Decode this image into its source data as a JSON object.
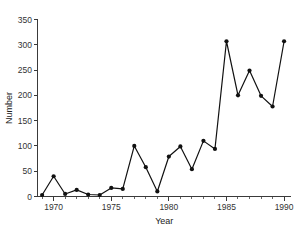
{
  "chart_data": {
    "type": "line",
    "title": "",
    "xlabel": "Year",
    "ylabel": "Number",
    "xlim": [
      1968.6,
      1990.6
    ],
    "ylim": [
      0,
      350
    ],
    "grid": false,
    "legend": null,
    "x": [
      1969,
      1970,
      1971,
      1972,
      1973,
      1974,
      1975,
      1976,
      1977,
      1978,
      1979,
      1980,
      1981,
      1982,
      1983,
      1984,
      1985,
      1986,
      1987,
      1988,
      1989,
      1990
    ],
    "values": [
      3,
      40,
      5,
      13,
      4,
      3,
      17,
      15,
      100,
      58,
      10,
      79,
      99,
      54,
      110,
      94,
      307,
      200,
      249,
      199,
      178,
      307
    ],
    "series": [
      {
        "name": "Number",
        "values": [
          3,
          40,
          5,
          13,
          4,
          3,
          17,
          15,
          100,
          58,
          10,
          79,
          99,
          54,
          110,
          94,
          307,
          200,
          249,
          199,
          178,
          307
        ],
        "color": "#111111",
        "marker": "filled-circle"
      }
    ],
    "y_ticks": [
      0,
      50,
      100,
      150,
      200,
      250,
      300,
      350
    ],
    "y_tick_labels": [
      "0",
      "50",
      "100",
      "150",
      "200",
      "250",
      "300",
      "350"
    ],
    "x_ticks_major": [
      1970,
      1975,
      1980,
      1985,
      1990
    ],
    "x_tick_labels": [
      "1970",
      "1975",
      "1980",
      "1985",
      "1990"
    ],
    "x_ticks_minor": [
      1969,
      1971,
      1972,
      1973,
      1974,
      1976,
      1977,
      1978,
      1979,
      1981,
      1982,
      1983,
      1984,
      1986,
      1987,
      1988,
      1989,
      1990
    ]
  },
  "colors": {
    "background": "#ffffff",
    "axis": "#3a3a3a",
    "line": "#111111",
    "text": "#222222"
  }
}
